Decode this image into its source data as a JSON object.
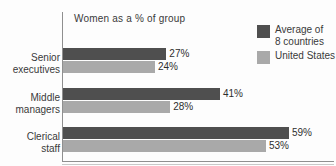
{
  "chart_data": {
    "type": "bar",
    "orientation": "horizontal",
    "title": "Women as a % of group",
    "xlabel": "",
    "ylabel": "",
    "xlim": [
      0,
      70
    ],
    "grid": false,
    "legend_position": "top-right",
    "categories": [
      "Senior executives",
      "Middle managers",
      "Clerical staff"
    ],
    "category_lines": [
      [
        "Senior",
        "executives"
      ],
      [
        "Middle",
        "managers"
      ],
      [
        "Clerical",
        "staff"
      ]
    ],
    "series": [
      {
        "name": "Average of 8 countries",
        "name_lines": [
          "Average of",
          "8 countries"
        ],
        "color": "#4f4f4f",
        "values": [
          27,
          41,
          59
        ],
        "labels": [
          "27%",
          "41%",
          "59%"
        ]
      },
      {
        "name": "United States",
        "name_lines": [
          "United States"
        ],
        "color": "#a9a9a9",
        "values": [
          24,
          28,
          53
        ],
        "labels": [
          "24%",
          "28%",
          "53%"
        ]
      }
    ]
  },
  "colors": {
    "background": "#fdfdfd",
    "axis": "#8f8f8f",
    "text": "#3a3a3a",
    "series_dark": "#4f4f4f",
    "series_light": "#a9a9a9"
  }
}
